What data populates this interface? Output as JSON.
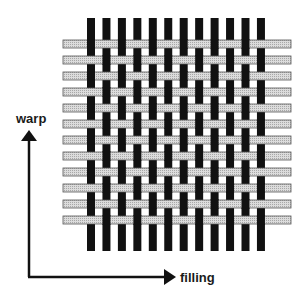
{
  "diagram": {
    "type": "plain-weave",
    "warp_count": 12,
    "filling_count": 12,
    "colors": {
      "warp": "#111111",
      "filling_fill": "#dcdcdc",
      "filling_grid": "#a8a8a8",
      "filling_outline": "#555555",
      "axis": "#111111"
    }
  },
  "labels": {
    "warp": "warp",
    "filling": "filling"
  }
}
